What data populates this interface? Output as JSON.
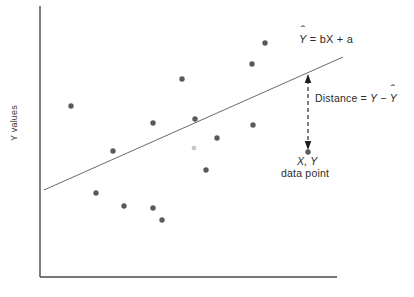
{
  "figure": {
    "background_color": "#ffffff"
  },
  "axes": {
    "y_axis_label": "Y values",
    "x_axis_label": "",
    "axis_color": "#4a4a4a",
    "x_axis": {
      "x1": 40,
      "y1": 277,
      "x2": 337,
      "y2": 277
    },
    "y_axis": {
      "x1": 40,
      "y1": 6,
      "x2": 40,
      "y2": 277
    }
  },
  "annotations": {
    "equation": {
      "text": "Y = bX + a",
      "hat_var": "Y",
      "rest": " = bX + a"
    },
    "distance": {
      "prefix": "Distance = ",
      "minuend": "Y",
      "operator": " − ",
      "hat_var": "Y"
    },
    "data_point_line1": "X, Y",
    "data_point_line2": "data point"
  },
  "chart_data": {
    "type": "scatter",
    "title": "",
    "xlabel": "",
    "ylabel": "Y values",
    "grid": false,
    "legend": null,
    "xlim": [
      40,
      337
    ],
    "ylim": [
      277,
      6
    ],
    "point_color": "#5a5a5a",
    "faint_point_color": "#c9c9c9",
    "line_color": "#6a6a6a",
    "points": [
      {
        "x": 71,
        "y": 106
      },
      {
        "x": 113,
        "y": 151
      },
      {
        "x": 96,
        "y": 193
      },
      {
        "x": 124,
        "y": 206
      },
      {
        "x": 153,
        "y": 123
      },
      {
        "x": 153,
        "y": 208
      },
      {
        "x": 162,
        "y": 220
      },
      {
        "x": 182,
        "y": 79
      },
      {
        "x": 195,
        "y": 119
      },
      {
        "x": 206,
        "y": 170
      },
      {
        "x": 217,
        "y": 138
      },
      {
        "x": 252,
        "y": 64
      },
      {
        "x": 253,
        "y": 125
      },
      {
        "x": 265,
        "y": 43
      },
      {
        "x": 308,
        "y": 152
      }
    ],
    "faint_points": [
      {
        "x": 194,
        "y": 148
      }
    ],
    "regression_line": {
      "x1": 44,
      "y1": 190,
      "x2": 343,
      "y2": 57
    },
    "residual_arrow": {
      "x": 308,
      "y_top": 74,
      "y_bottom": 150,
      "style": "dashed-double-headed"
    },
    "highlighted_point": {
      "x": 308,
      "y": 152,
      "label": "X, Y data point"
    }
  }
}
